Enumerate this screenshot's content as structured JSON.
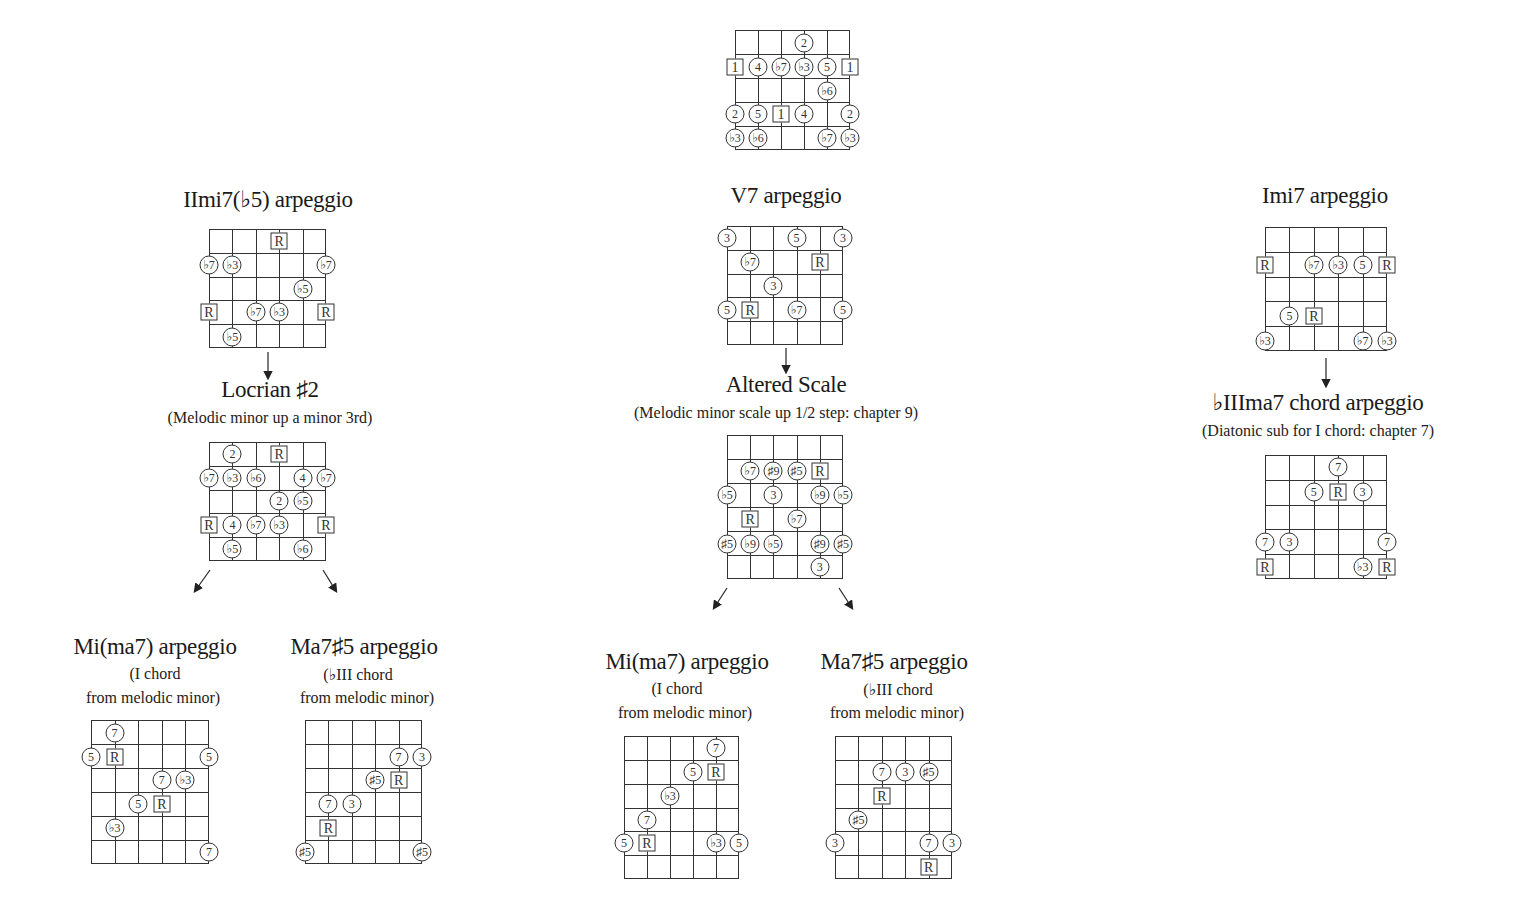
{
  "colors": {
    "line": "#333333",
    "text": "#1a1a1a",
    "background": "#ffffff"
  },
  "top_scale": {
    "label": "",
    "grid": {
      "x": 735,
      "y": 30,
      "w": 115,
      "h": 120,
      "strings": 6,
      "frets": 5
    },
    "markers": [
      {
        "s": 3,
        "y": 43,
        "t": "2",
        "shape": "circle"
      },
      {
        "s": 0,
        "y": 67,
        "t": "1",
        "shape": "square"
      },
      {
        "s": 1,
        "y": 67,
        "t": "4",
        "shape": "circle"
      },
      {
        "s": 2,
        "y": 67,
        "t": "♭7",
        "shape": "circle"
      },
      {
        "s": 3,
        "y": 67,
        "t": "♭3",
        "shape": "circle"
      },
      {
        "s": 4,
        "y": 67,
        "t": "5",
        "shape": "circle"
      },
      {
        "s": 5,
        "y": 67,
        "t": "1",
        "shape": "square"
      },
      {
        "s": 4,
        "y": 91,
        "t": "♭6",
        "shape": "circle"
      },
      {
        "s": 0,
        "y": 114,
        "t": "2",
        "shape": "circle"
      },
      {
        "s": 1,
        "y": 114,
        "t": "5",
        "shape": "circle"
      },
      {
        "s": 2,
        "y": 114,
        "t": "1",
        "shape": "square"
      },
      {
        "s": 3,
        "y": 114,
        "t": "4",
        "shape": "circle"
      },
      {
        "s": 5,
        "y": 114,
        "t": "2",
        "shape": "circle"
      },
      {
        "s": 0,
        "y": 138,
        "t": "♭3",
        "shape": "circle"
      },
      {
        "s": 1,
        "y": 138,
        "t": "♭6",
        "shape": "circle"
      },
      {
        "s": 4,
        "y": 138,
        "t": "♭7",
        "shape": "circle"
      },
      {
        "s": 5,
        "y": 138,
        "t": "♭3",
        "shape": "circle"
      }
    ]
  },
  "columns": [
    {
      "name": "left",
      "sections": [
        {
          "title": "IImi7(♭5) arpeggio",
          "title_x": 268,
          "title_y": 188,
          "subtitle": null
        },
        {
          "title": "Locrian ♯2",
          "title_x": 270,
          "title_y": 379,
          "subtitle": "(Melodic minor up a minor 3rd)",
          "sub_x": 270,
          "sub_y": 408
        }
      ]
    },
    {
      "name": "center",
      "sections": [
        {
          "title": "V7 arpeggio",
          "title_x": 786,
          "title_y": 184,
          "subtitle": null
        },
        {
          "title": "Altered Scale",
          "title_x": 786,
          "title_y": 373,
          "subtitle": "(Melodic minor scale up 1/2 step: chapter 9)",
          "sub_x": 776,
          "sub_y": 404
        }
      ]
    },
    {
      "name": "right",
      "sections": [
        {
          "title": "Imi7 arpeggio",
          "title_x": 1325,
          "title_y": 184,
          "subtitle": null
        },
        {
          "title": "♭IIIma7 chord arpeggio",
          "title_x": 1318,
          "title_y": 390,
          "subtitle": "(Diatonic sub for I chord: chapter 7)",
          "sub_x": 1318,
          "sub_y": 422
        }
      ]
    }
  ],
  "bottom_titles": [
    {
      "title": "Mi(ma7) arpeggio",
      "x": 155,
      "y": 634,
      "line2": "(I chord",
      "line2_x": 155,
      "line2_y": 666,
      "line3": "from melodic minor)",
      "line3_x": 153,
      "line3_y": 689
    },
    {
      "title": "Ma7♯5 arpeggio",
      "x": 364,
      "y": 634,
      "line2": "(♭III chord",
      "line2_x": 358,
      "line2_y": 666,
      "line3": "from melodic minor)",
      "line3_x": 367,
      "line3_y": 689
    },
    {
      "title": "Mi(ma7) arpeggio",
      "x": 687,
      "y": 649,
      "line2": "(I chord",
      "line2_x": 677,
      "line2_y": 681,
      "line3": "from melodic minor)",
      "line3_x": 685,
      "line3_y": 704
    },
    {
      "title": "Ma7♯5 arpeggio",
      "x": 894,
      "y": 649,
      "line2": "(♭III chord",
      "line2_x": 898,
      "line2_y": 681,
      "line3": "from melodic minor)",
      "line3_x": 897,
      "line3_y": 704
    }
  ],
  "diagrams": [
    {
      "name": "iimi7b5-arpeggio",
      "grid": {
        "x": 209,
        "y": 229,
        "w": 117,
        "h": 119,
        "strings": 6,
        "frets": 5
      },
      "markers": [
        {
          "s": 3,
          "y": 241,
          "t": "R",
          "shape": "square"
        },
        {
          "s": 0,
          "y": 265,
          "t": "♭7",
          "shape": "circle"
        },
        {
          "s": 1,
          "y": 265,
          "t": "♭3",
          "shape": "circle"
        },
        {
          "s": 5,
          "y": 265,
          "t": "♭7",
          "shape": "circle"
        },
        {
          "s": 4,
          "y": 289,
          "t": "♭5",
          "shape": "circle"
        },
        {
          "s": 0,
          "y": 312,
          "t": "R",
          "shape": "square"
        },
        {
          "s": 2,
          "y": 312,
          "t": "♭7",
          "shape": "circle"
        },
        {
          "s": 3,
          "y": 312,
          "t": "♭3",
          "shape": "circle"
        },
        {
          "s": 5,
          "y": 312,
          "t": "R",
          "shape": "square"
        },
        {
          "s": 1,
          "y": 337,
          "t": "♭5",
          "shape": "circle"
        }
      ]
    },
    {
      "name": "locrian-sharp2-scale",
      "grid": {
        "x": 209,
        "y": 442,
        "w": 117,
        "h": 119,
        "strings": 6,
        "frets": 5
      },
      "markers": [
        {
          "s": 1,
          "y": 454,
          "t": "2",
          "shape": "circle"
        },
        {
          "s": 3,
          "y": 454,
          "t": "R",
          "shape": "square"
        },
        {
          "s": 0,
          "y": 478,
          "t": "♭7",
          "shape": "circle"
        },
        {
          "s": 1,
          "y": 478,
          "t": "♭3",
          "shape": "circle"
        },
        {
          "s": 2,
          "y": 478,
          "t": "♭6",
          "shape": "circle"
        },
        {
          "s": 4,
          "y": 478,
          "t": "4",
          "shape": "circle"
        },
        {
          "s": 5,
          "y": 478,
          "t": "♭7",
          "shape": "circle"
        },
        {
          "s": 3,
          "y": 501,
          "t": "2",
          "shape": "circle"
        },
        {
          "s": 4,
          "y": 501,
          "t": "♭5",
          "shape": "circle"
        },
        {
          "s": 0,
          "y": 525,
          "t": "R",
          "shape": "square"
        },
        {
          "s": 1,
          "y": 525,
          "t": "4",
          "shape": "circle"
        },
        {
          "s": 2,
          "y": 525,
          "t": "♭7",
          "shape": "circle"
        },
        {
          "s": 3,
          "y": 525,
          "t": "♭3",
          "shape": "circle"
        },
        {
          "s": 5,
          "y": 525,
          "t": "R",
          "shape": "square"
        },
        {
          "s": 1,
          "y": 549,
          "t": "♭5",
          "shape": "circle"
        },
        {
          "s": 4,
          "y": 549,
          "t": "♭6",
          "shape": "circle"
        }
      ]
    },
    {
      "name": "v7-arpeggio",
      "grid": {
        "x": 727,
        "y": 226,
        "w": 116,
        "h": 119,
        "strings": 6,
        "frets": 5
      },
      "markers": [
        {
          "s": 0,
          "y": 238,
          "t": "3",
          "shape": "circle"
        },
        {
          "s": 3,
          "y": 238,
          "t": "5",
          "shape": "circle"
        },
        {
          "s": 5,
          "y": 238,
          "t": "3",
          "shape": "circle"
        },
        {
          "s": 1,
          "y": 262,
          "t": "♭7",
          "shape": "circle"
        },
        {
          "s": 4,
          "y": 262,
          "t": "R",
          "shape": "square"
        },
        {
          "s": 2,
          "y": 286,
          "t": "3",
          "shape": "circle"
        },
        {
          "s": 0,
          "y": 310,
          "t": "5",
          "shape": "circle"
        },
        {
          "s": 1,
          "y": 310,
          "t": "R",
          "shape": "square"
        },
        {
          "s": 3,
          "y": 310,
          "t": "♭7",
          "shape": "circle"
        },
        {
          "s": 5,
          "y": 310,
          "t": "5",
          "shape": "circle"
        }
      ]
    },
    {
      "name": "altered-scale",
      "grid": {
        "x": 727,
        "y": 435,
        "w": 116,
        "h": 144,
        "strings": 6,
        "frets": 6
      },
      "markers": [
        {
          "s": 1,
          "y": 471,
          "t": "♭7",
          "shape": "circle"
        },
        {
          "s": 2,
          "y": 471,
          "t": "♯9",
          "shape": "circle"
        },
        {
          "s": 3,
          "y": 471,
          "t": "♯5",
          "shape": "circle"
        },
        {
          "s": 4,
          "y": 471,
          "t": "R",
          "shape": "square"
        },
        {
          "s": 0,
          "y": 495,
          "t": "♭5",
          "shape": "circle"
        },
        {
          "s": 2,
          "y": 495,
          "t": "3",
          "shape": "circle"
        },
        {
          "s": 4,
          "y": 495,
          "t": "♭9",
          "shape": "circle"
        },
        {
          "s": 5,
          "y": 495,
          "t": "♭5",
          "shape": "circle"
        },
        {
          "s": 1,
          "y": 519,
          "t": "R",
          "shape": "square"
        },
        {
          "s": 3,
          "y": 519,
          "t": "♭7",
          "shape": "circle"
        },
        {
          "s": 0,
          "y": 544,
          "t": "♯5",
          "shape": "circle"
        },
        {
          "s": 1,
          "y": 544,
          "t": "♭9",
          "shape": "circle"
        },
        {
          "s": 2,
          "y": 544,
          "t": "♭5",
          "shape": "circle"
        },
        {
          "s": 4,
          "y": 544,
          "t": "♯9",
          "shape": "circle"
        },
        {
          "s": 5,
          "y": 544,
          "t": "♯5",
          "shape": "circle"
        },
        {
          "s": 4,
          "y": 567,
          "t": "3",
          "shape": "circle"
        }
      ]
    },
    {
      "name": "imi7-arpeggio",
      "grid": {
        "x": 1265,
        "y": 227,
        "w": 122,
        "h": 124,
        "strings": 6,
        "frets": 5
      },
      "markers": [
        {
          "s": 0,
          "y": 265,
          "t": "R",
          "shape": "square"
        },
        {
          "s": 2,
          "y": 265,
          "t": "♭7",
          "shape": "circle"
        },
        {
          "s": 3,
          "y": 265,
          "t": "♭3",
          "shape": "circle"
        },
        {
          "s": 4,
          "y": 265,
          "t": "5",
          "shape": "circle"
        },
        {
          "s": 5,
          "y": 265,
          "t": "R",
          "shape": "square"
        },
        {
          "s": 1,
          "y": 316,
          "t": "5",
          "shape": "circle"
        },
        {
          "s": 2,
          "y": 316,
          "t": "R",
          "shape": "square"
        },
        {
          "s": 0,
          "y": 341,
          "t": "♭3",
          "shape": "circle"
        },
        {
          "s": 4,
          "y": 341,
          "t": "♭7",
          "shape": "circle"
        },
        {
          "s": 5,
          "y": 341,
          "t": "♭3",
          "shape": "circle"
        }
      ]
    },
    {
      "name": "biiima7-arpeggio",
      "grid": {
        "x": 1265,
        "y": 455,
        "w": 122,
        "h": 124,
        "strings": 6,
        "frets": 5
      },
      "markers": [
        {
          "s": 3,
          "y": 467,
          "t": "7",
          "shape": "circle"
        },
        {
          "s": 2,
          "y": 492,
          "t": "5",
          "shape": "circle"
        },
        {
          "s": 3,
          "y": 492,
          "t": "R",
          "shape": "square"
        },
        {
          "s": 4,
          "y": 492,
          "t": "3",
          "shape": "circle"
        },
        {
          "s": 0,
          "y": 542,
          "t": "7",
          "shape": "circle"
        },
        {
          "s": 1,
          "y": 542,
          "t": "3",
          "shape": "circle"
        },
        {
          "s": 5,
          "y": 542,
          "t": "7",
          "shape": "circle"
        },
        {
          "s": 0,
          "y": 567,
          "t": "R",
          "shape": "square"
        },
        {
          "s": 4,
          "y": 567,
          "t": "♭3",
          "shape": "circle"
        },
        {
          "s": 5,
          "y": 567,
          "t": "R",
          "shape": "square"
        }
      ]
    },
    {
      "name": "left-mima7-arpeggio",
      "grid": {
        "x": 91,
        "y": 720,
        "w": 118,
        "h": 144,
        "strings": 6,
        "frets": 6
      },
      "markers": [
        {
          "s": 1,
          "y": 733,
          "t": "7",
          "shape": "circle"
        },
        {
          "s": 0,
          "y": 757,
          "t": "5",
          "shape": "circle"
        },
        {
          "s": 1,
          "y": 757,
          "t": "R",
          "shape": "square"
        },
        {
          "s": 5,
          "y": 757,
          "t": "5",
          "shape": "circle"
        },
        {
          "s": 3,
          "y": 780,
          "t": "7",
          "shape": "circle"
        },
        {
          "s": 4,
          "y": 780,
          "t": "♭3",
          "shape": "circle"
        },
        {
          "s": 2,
          "y": 804,
          "t": "5",
          "shape": "circle"
        },
        {
          "s": 3,
          "y": 804,
          "t": "R",
          "shape": "square"
        },
        {
          "s": 1,
          "y": 828,
          "t": "♭3",
          "shape": "circle"
        },
        {
          "s": 5,
          "y": 852,
          "t": "7",
          "shape": "circle"
        }
      ]
    },
    {
      "name": "left-ma7sharp5-arpeggio",
      "grid": {
        "x": 305,
        "y": 720,
        "w": 117,
        "h": 144,
        "strings": 6,
        "frets": 6
      },
      "markers": [
        {
          "s": 4,
          "y": 757,
          "t": "7",
          "shape": "circle"
        },
        {
          "s": 5,
          "y": 757,
          "t": "3",
          "shape": "circle"
        },
        {
          "s": 3,
          "y": 780,
          "t": "♯5",
          "shape": "circle"
        },
        {
          "s": 4,
          "y": 780,
          "t": "R",
          "shape": "square"
        },
        {
          "s": 1,
          "y": 804,
          "t": "7",
          "shape": "circle"
        },
        {
          "s": 2,
          "y": 804,
          "t": "3",
          "shape": "circle"
        },
        {
          "s": 1,
          "y": 828,
          "t": "R",
          "shape": "square"
        },
        {
          "s": 0,
          "y": 852,
          "t": "♯5",
          "shape": "circle"
        },
        {
          "s": 5,
          "y": 852,
          "t": "♯5",
          "shape": "circle"
        }
      ]
    },
    {
      "name": "center-mima7-arpeggio",
      "grid": {
        "x": 624,
        "y": 736,
        "w": 115,
        "h": 143,
        "strings": 6,
        "frets": 6
      },
      "markers": [
        {
          "s": 4,
          "y": 748,
          "t": "7",
          "shape": "circle"
        },
        {
          "s": 3,
          "y": 772,
          "t": "5",
          "shape": "circle"
        },
        {
          "s": 4,
          "y": 772,
          "t": "R",
          "shape": "square"
        },
        {
          "s": 2,
          "y": 796,
          "t": "♭3",
          "shape": "circle"
        },
        {
          "s": 1,
          "y": 820,
          "t": "7",
          "shape": "circle"
        },
        {
          "s": 0,
          "y": 843,
          "t": "5",
          "shape": "circle"
        },
        {
          "s": 1,
          "y": 843,
          "t": "R",
          "shape": "square"
        },
        {
          "s": 4,
          "y": 843,
          "t": "♭3",
          "shape": "circle"
        },
        {
          "s": 5,
          "y": 843,
          "t": "5",
          "shape": "circle"
        }
      ]
    },
    {
      "name": "center-ma7sharp5-arpeggio",
      "grid": {
        "x": 835,
        "y": 736,
        "w": 117,
        "h": 143,
        "strings": 6,
        "frets": 6
      },
      "markers": [
        {
          "s": 2,
          "y": 772,
          "t": "7",
          "shape": "circle"
        },
        {
          "s": 3,
          "y": 772,
          "t": "3",
          "shape": "circle"
        },
        {
          "s": 4,
          "y": 772,
          "t": "♯5",
          "shape": "circle"
        },
        {
          "s": 2,
          "y": 796,
          "t": "R",
          "shape": "square"
        },
        {
          "s": 1,
          "y": 820,
          "t": "♯5",
          "shape": "circle"
        },
        {
          "s": 0,
          "y": 843,
          "t": "3",
          "shape": "circle"
        },
        {
          "s": 4,
          "y": 843,
          "t": "7",
          "shape": "circle"
        },
        {
          "s": 5,
          "y": 843,
          "t": "3",
          "shape": "circle"
        },
        {
          "s": 4,
          "y": 867,
          "t": "R",
          "shape": "square"
        }
      ]
    }
  ],
  "arrows": [
    {
      "x1": 268,
      "y1": 352,
      "x2": 268,
      "y2": 378
    },
    {
      "x1": 210,
      "y1": 570,
      "x2": 195,
      "y2": 591
    },
    {
      "x1": 323,
      "y1": 570,
      "x2": 336,
      "y2": 591
    },
    {
      "x1": 786,
      "y1": 348,
      "x2": 786,
      "y2": 372
    },
    {
      "x1": 727,
      "y1": 588,
      "x2": 714,
      "y2": 608
    },
    {
      "x1": 839,
      "y1": 588,
      "x2": 852,
      "y2": 608
    },
    {
      "x1": 1326,
      "y1": 358,
      "x2": 1326,
      "y2": 386
    }
  ]
}
